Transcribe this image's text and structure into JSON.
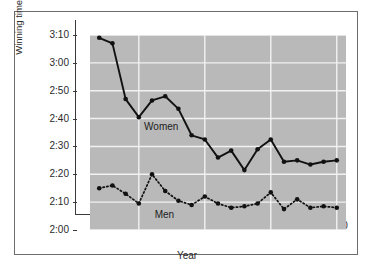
{
  "chart_data": {
    "type": "line",
    "title": "",
    "xlabel": "Year",
    "ylabel": "Winning time (hours:minutes)",
    "xlim": [
      1971.3,
      1990.7
    ],
    "ylim": [
      120,
      190
    ],
    "grid": true,
    "legend_position": "inline-annotation",
    "x_tick_labels": [
      "1975",
      "1980",
      "1985",
      "1990"
    ],
    "x_tick_values": [
      1975,
      1980,
      1985,
      1990
    ],
    "y_tick_labels": [
      "2:00",
      "2:10",
      "2:20",
      "2:30",
      "2:40",
      "2:50",
      "3:00",
      "3:10"
    ],
    "y_tick_values": [
      120,
      130,
      140,
      150,
      160,
      170,
      180,
      190
    ],
    "y_unit": "minutes",
    "x": [
      1972,
      1973,
      1974,
      1975,
      1976,
      1977,
      1978,
      1979,
      1980,
      1981,
      1982,
      1983,
      1984,
      1985,
      1986,
      1987,
      1988,
      1989,
      1990
    ],
    "series": [
      {
        "name": "Women",
        "style": "solid",
        "marker": "filled-circle",
        "color": "#111111",
        "values": [
          189.0,
          187.0,
          167.0,
          160.5,
          166.5,
          168.0,
          163.5,
          154.0,
          152.5,
          146.0,
          148.5,
          141.5,
          149.0,
          152.5,
          144.5,
          145.0,
          143.5,
          144.5,
          145.0
        ],
        "labels": [
          "3:09",
          "3:07",
          "2:47",
          "2:40",
          "2:46",
          "2:48",
          "2:43",
          "2:34",
          "2:32",
          "2:26",
          "2:28",
          "2:21",
          "2:29",
          "2:32",
          "2:24",
          "2:25",
          "2:23",
          "2:24",
          "2:25"
        ]
      },
      {
        "name": "Men",
        "style": "dotted",
        "marker": "filled-circle",
        "color": "#111111",
        "values": [
          135.0,
          136.0,
          133.0,
          129.5,
          140.0,
          134.0,
          130.5,
          129.0,
          132.0,
          129.5,
          128.0,
          128.5,
          129.5,
          133.5,
          127.5,
          131.0,
          128.0,
          128.5,
          128.0
        ],
        "labels": [
          "2:15",
          "2:16",
          "2:13",
          "2:09",
          "2:20",
          "2:14",
          "2:10",
          "2:09",
          "2:12",
          "2:09",
          "2:08",
          "2:08",
          "2:09",
          "2:13",
          "2:07",
          "2:11",
          "2:08",
          "2:08",
          "2:08"
        ]
      }
    ],
    "annotations": [
      {
        "text": "Women",
        "x": 1975.4,
        "y": 157.0
      },
      {
        "text": "Men",
        "x": 1976.2,
        "y": 125.5
      }
    ]
  },
  "colors": {
    "plot_background": "#b9b9b9",
    "gridline": "#f2f2f2",
    "axis": "#3a3a3a",
    "series": "#111111",
    "frame_border": "#6d6d6d",
    "page_background": "#ffffff",
    "text": "#2a2a2a"
  }
}
